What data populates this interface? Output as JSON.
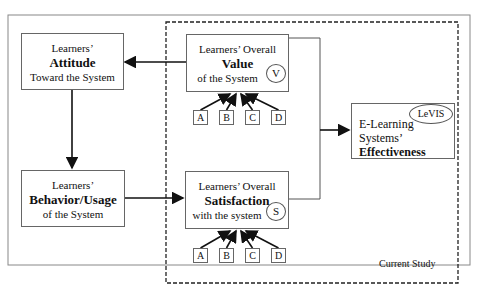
{
  "diagram": {
    "attitude": {
      "line1": "Learners’",
      "bold": "Attitude",
      "line3": "Toward the System"
    },
    "behavior": {
      "line1": "Learners’",
      "bold": "Behavior/Usage",
      "line3": "of the System"
    },
    "value": {
      "line1": "Learners’ Overall",
      "bold": "Value",
      "line3": "of the System",
      "badge": "V"
    },
    "satisfaction": {
      "line1": "Learners’ Overall",
      "bold": "Satisfaction",
      "line3": "with the system",
      "badge": "S"
    },
    "effectiveness": {
      "line1": "E-Learning",
      "line2": "Systems’",
      "bold": "Effectiveness",
      "badge": "LeVIS"
    },
    "value_factors": [
      "A",
      "B",
      "C",
      "D"
    ],
    "satisfaction_factors": [
      "A",
      "B",
      "C",
      "D"
    ],
    "region_label": "Current Study"
  }
}
